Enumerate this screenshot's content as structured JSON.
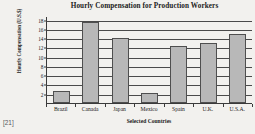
{
  "footnote": "[21]",
  "colors": {
    "background": "#f2f1ee",
    "bar_fill": "#b8b8b8",
    "bar_border": "#4f4f4f",
    "axis": "#3a3a3a",
    "grid": "#4a4a4a",
    "text": "#1b1b1b"
  },
  "chart_data": {
    "type": "bar",
    "title": "Hourly Compensation for Production Workers",
    "xlabel": "Selected Countries",
    "ylabel": "Hourly Compensation (U.S.$)",
    "categories": [
      "Brazil",
      "Canada",
      "Japan",
      "Mexico",
      "Spain",
      "U.K.",
      "U.S.A."
    ],
    "values": [
      2.6,
      17.4,
      14.1,
      2.1,
      12.3,
      13.0,
      14.9
    ],
    "ylim": [
      0,
      18.8
    ],
    "yticks": [
      2,
      4,
      6,
      8,
      10,
      12,
      14,
      16,
      18
    ],
    "ytick_labels": [
      "2",
      "4",
      "6",
      "8",
      "10",
      "12",
      "14",
      "16",
      "18"
    ],
    "grid": true,
    "grid_axis": "y",
    "legend": false,
    "legend_position": "none"
  }
}
